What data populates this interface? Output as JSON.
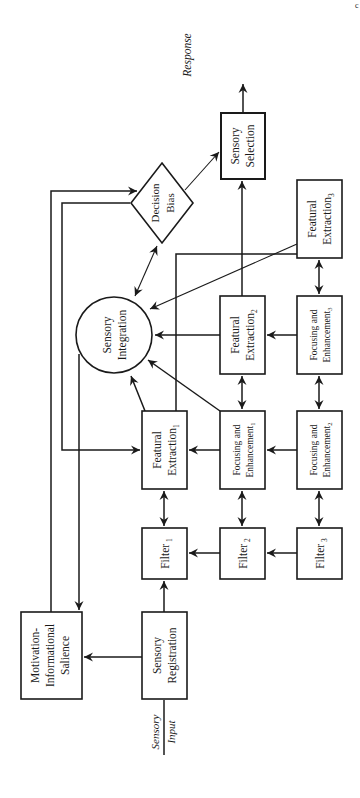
{
  "diagram": {
    "orientation": "rotated-90-ccw",
    "page_mark": "c",
    "input_label": {
      "line1": "Sensory",
      "line2": "Input"
    },
    "output_label": "Response",
    "nodes": {
      "motivation": {
        "line1": "Motivation-",
        "line2": "Informational",
        "line3": "Salience"
      },
      "registration": {
        "line1": "Sensory",
        "line2": "Registration"
      },
      "filter1": {
        "text": "Filter",
        "sub": "1"
      },
      "filter2": {
        "text": "Filter",
        "sub": "2"
      },
      "filter3": {
        "text": "Filter",
        "sub": "3"
      },
      "featural1": {
        "line1": "Featural",
        "line2": "Extraction",
        "sub": "1"
      },
      "featural2": {
        "line1": "Featural",
        "line2": "Extraction",
        "sub": "2"
      },
      "featural3": {
        "line1": "Featural",
        "line2": "Extraction",
        "sub": "3"
      },
      "focusing1": {
        "line1": "Focusing and",
        "line2": "Enhancement",
        "sub": "1"
      },
      "focusing2": {
        "line1": "Focusing and",
        "line2": "Enhancement",
        "sub": "2"
      },
      "focusing3": {
        "line1": "Focusing and",
        "line2": "Enhancement",
        "sub": "3"
      },
      "integration": {
        "line1": "Sensory",
        "line2": "Integration"
      },
      "decision": {
        "line1": "Decision",
        "line2": "Bias"
      },
      "selection": {
        "line1": "Sensory",
        "line2": "Selection"
      }
    },
    "edges": [
      {
        "from": "Sensory Input",
        "to": "Sensory Registration"
      },
      {
        "from": "Sensory Registration",
        "to": "Motivation-Informational Salience"
      },
      {
        "from": "Sensory Registration",
        "to": "Filter 1"
      },
      {
        "from": "Filter 2",
        "to": "Filter 1"
      },
      {
        "from": "Filter 3",
        "to": "Filter 2"
      },
      {
        "from": "Filter 1",
        "to": "Featural Extraction 1",
        "bidirectional": true
      },
      {
        "from": "Filter 2",
        "to": "Focusing and Enhancement 1",
        "bidirectional": true
      },
      {
        "from": "Filter 3",
        "to": "Focusing and Enhancement 2",
        "bidirectional": true
      },
      {
        "from": "Focusing and Enhancement 1",
        "to": "Featural Extraction 1"
      },
      {
        "from": "Focusing and Enhancement 2",
        "to": "Focusing and Enhancement 1"
      },
      {
        "from": "Focusing and Enhancement 1",
        "to": "Featural Extraction 2",
        "bidirectional": true
      },
      {
        "from": "Focusing and Enhancement 2",
        "to": "Focusing and Enhancement 3",
        "bidirectional": true
      },
      {
        "from": "Focusing and Enhancement 3",
        "to": "Featural Extraction 2"
      },
      {
        "from": "Focusing and Enhancement 3",
        "to": "Featural Extraction 3",
        "bidirectional": true
      },
      {
        "from": "Featural Extraction 1",
        "to": "Sensory Integration"
      },
      {
        "from": "Focusing and Enhancement 1",
        "to": "Sensory Integration"
      },
      {
        "from": "Featural Extraction 2",
        "to": "Sensory Integration"
      },
      {
        "from": "Featural Extraction 3",
        "to": "Sensory Integration"
      },
      {
        "from": "Featural Extraction 1",
        "to": "Sensory Selection"
      },
      {
        "from": "Featural Extraction 2",
        "to": "Sensory Selection"
      },
      {
        "from": "Sensory Integration",
        "to": "Decision Bias",
        "bidirectional": true
      },
      {
        "from": "Sensory Integration",
        "to": "Motivation-Informational Salience"
      },
      {
        "from": "Motivation-Informational Salience",
        "to": "Decision Bias"
      },
      {
        "from": "Decision Bias",
        "to": "Featural Extraction 1"
      },
      {
        "from": "Decision Bias",
        "to": "Sensory Selection"
      },
      {
        "from": "Sensory Selection",
        "to": "Response"
      }
    ]
  }
}
